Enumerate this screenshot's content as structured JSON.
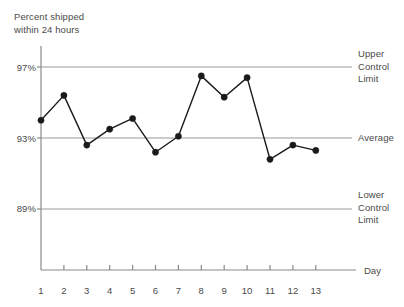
{
  "chart_data": {
    "type": "line",
    "title": "Percent shipped\nwithin 24 hours",
    "xlabel": "Day",
    "ylabel": "Percent shipped within 24 hours",
    "categories": [
      1,
      2,
      3,
      4,
      5,
      6,
      7,
      8,
      9,
      10,
      11,
      12,
      13
    ],
    "x_tick_labels": [
      "1",
      "2",
      "3",
      "4",
      "5",
      "6",
      "7",
      "8",
      "9",
      "10",
      "11",
      "12",
      "13"
    ],
    "values": [
      94.0,
      95.4,
      92.6,
      93.5,
      94.1,
      92.2,
      93.1,
      96.5,
      95.3,
      96.4,
      91.8,
      92.6,
      92.3
    ],
    "y_tick_labels": [
      "97%",
      "93%",
      "89%"
    ],
    "y_tick_values": [
      97,
      93,
      89
    ],
    "ylim": [
      87.4,
      98.2
    ],
    "xlim": [
      1,
      13
    ],
    "grid": true,
    "legend": false,
    "marker": "circle",
    "reference_lines": [
      {
        "name": "upper-control-limit",
        "label": "Upper\nControl\nLimit",
        "value": 97
      },
      {
        "name": "average",
        "label": "Average",
        "value": 93
      },
      {
        "name": "lower-control-limit",
        "label": "Lower\nControl\nLimit",
        "value": 89
      }
    ],
    "colors": {
      "series": "#1a1a1a",
      "gridline": "#9a9a9a",
      "axis": "#8a8a8a",
      "text": "#4a4a4a",
      "background": "#ffffff"
    }
  }
}
